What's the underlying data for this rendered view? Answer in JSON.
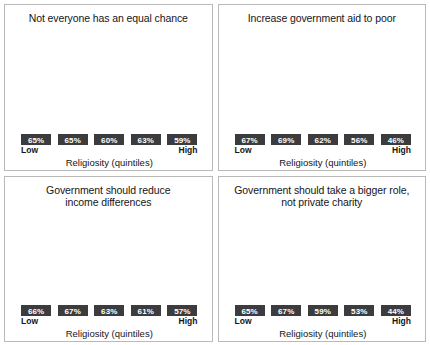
{
  "figure": {
    "panel_count": 4,
    "bar_color": "#3c3c3e",
    "panel_border_color": "#b9b9b9",
    "background": "#ffffff",
    "value_label_color": "#ffffff"
  },
  "chart_data": [
    {
      "type": "bar",
      "title": "Not everyone has an equal chance",
      "title_lines": [
        "Not everyone has an equal chance",
        ""
      ],
      "categories": [
        "Low",
        "2",
        "3",
        "4",
        "High"
      ],
      "values": [
        65,
        65,
        60,
        63,
        59
      ],
      "value_labels": [
        "65%",
        "65%",
        "60%",
        "63%",
        "59%"
      ],
      "xlabel": "Religiosity (quintiles)",
      "ylabel": "",
      "axis_low_label": "Low",
      "axis_high_label": "High",
      "ylim": [
        19,
        73
      ],
      "grid": false,
      "legend": "none"
    },
    {
      "type": "bar",
      "title": "Increase government aid to poor",
      "title_lines": [
        "Increase government aid to poor",
        ""
      ],
      "categories": [
        "Low",
        "2",
        "3",
        "4",
        "High"
      ],
      "values": [
        67,
        69,
        62,
        56,
        46
      ],
      "value_labels": [
        "67%",
        "69%",
        "62%",
        "56%",
        "46%"
      ],
      "xlabel": "Religiosity (quintiles)",
      "ylabel": "",
      "axis_low_label": "Low",
      "axis_high_label": "High",
      "ylim": [
        19,
        73
      ],
      "grid": false,
      "legend": "none"
    },
    {
      "type": "bar",
      "title": "Government should reduce income differences",
      "title_lines": [
        "Government should reduce",
        "income differences"
      ],
      "categories": [
        "Low",
        "2",
        "3",
        "4",
        "High"
      ],
      "values": [
        66,
        67,
        63,
        61,
        57
      ],
      "value_labels": [
        "66%",
        "67%",
        "63%",
        "61%",
        "57%"
      ],
      "xlabel": "Religiosity (quintiles)",
      "ylabel": "",
      "axis_low_label": "Low",
      "axis_high_label": "High",
      "ylim": [
        19,
        73
      ],
      "grid": false,
      "legend": "none"
    },
    {
      "type": "bar",
      "title": "Government should take a bigger role, not private charity",
      "title_lines": [
        "Government should take a bigger role,",
        "not private charity"
      ],
      "categories": [
        "Low",
        "2",
        "3",
        "4",
        "High"
      ],
      "values": [
        65,
        67,
        59,
        53,
        44
      ],
      "value_labels": [
        "65%",
        "67%",
        "59%",
        "53%",
        "44%"
      ],
      "xlabel": "Religiosity (quintiles)",
      "ylabel": "",
      "axis_low_label": "Low",
      "axis_high_label": "High",
      "ylim": [
        19,
        73
      ],
      "grid": false,
      "legend": "none"
    }
  ]
}
